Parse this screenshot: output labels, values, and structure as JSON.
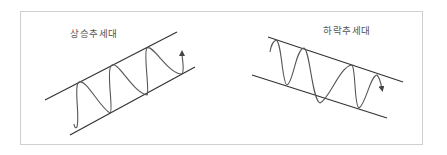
{
  "diagram": {
    "colors": {
      "line": "#333333",
      "wave": "#555555",
      "border": "#cfcfcf",
      "text": "#555555"
    },
    "panels": [
      {
        "id": "uptrend",
        "title": "상승추세대",
        "direction": "up",
        "arrow": "up"
      },
      {
        "id": "downtrend",
        "title": "하락추세대",
        "direction": "down",
        "arrow": "down"
      }
    ]
  }
}
